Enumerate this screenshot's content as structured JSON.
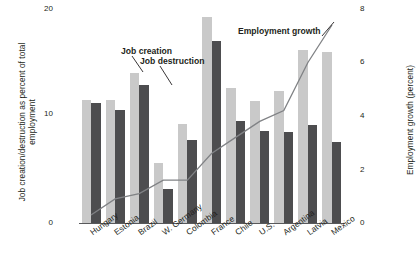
{
  "chart_data": {
    "type": "bar",
    "title": "",
    "categories": [
      "Hungary",
      "Estonia",
      "Brazil",
      "W. Germany",
      "Colombia",
      "France",
      "Chile",
      "U.S.",
      "Argentina",
      "Latvia",
      "Mexico"
    ],
    "series": [
      {
        "name": "Job creation",
        "axis": "left",
        "color": "#c9c9c9",
        "values": [
          11.5,
          11.5,
          14.0,
          5.6,
          9.3,
          19.3,
          12.6,
          11.4,
          12.3,
          16.2,
          16.0
        ]
      },
      {
        "name": "Job destruction",
        "axis": "left",
        "color": "#4d4d4f",
        "values": [
          11.2,
          10.6,
          12.9,
          3.2,
          7.8,
          17.0,
          9.5,
          8.6,
          8.5,
          9.2,
          7.6
        ]
      },
      {
        "name": "Employment growth",
        "axis": "right",
        "color": "#808285",
        "type": "line",
        "values": [
          0.3,
          0.9,
          1.1,
          1.6,
          1.6,
          2.6,
          3.2,
          3.8,
          4.2,
          6.0,
          7.4
        ]
      }
    ],
    "xlabel": "",
    "ylabel": "Job creation/destruction as percent of total employment",
    "ylabel_right": "Employment growth (percent)",
    "ylim": [
      0,
      20
    ],
    "yticks": [
      "0",
      "10",
      "20"
    ],
    "ylim_right": [
      0,
      8
    ],
    "yticks_right": [
      "0",
      "2",
      "4",
      "6",
      "8"
    ],
    "grid": false,
    "legend": "annotations",
    "annotations": [
      {
        "id": "job-creation",
        "text": "Job creation"
      },
      {
        "id": "job-destruction",
        "text": "Job destruction"
      },
      {
        "id": "employment-growth",
        "text": "Employment growth"
      }
    ]
  },
  "axis": {
    "left_title": "Job creation/destruction as percent of total employment",
    "right_title": "Employment growth (percent)",
    "left_ticks": {
      "t0": "0",
      "t1": "10",
      "t2": "20"
    },
    "right_ticks": {
      "t0": "0",
      "t1": "2",
      "t2": "4",
      "t3": "6",
      "t4": "8"
    }
  },
  "annotations": {
    "job_creation": "Job creation",
    "job_destruction": "Job destruction",
    "employment_growth": "Employment growth"
  },
  "categories": {
    "c0": "Hungary",
    "c1": "Estonia",
    "c2": "Brazil",
    "c3": "W. Germany",
    "c4": "Colombia",
    "c5": "France",
    "c6": "Chile",
    "c7": "U.S.",
    "c8": "Argentina",
    "c9": "Latvia",
    "c10": "Mexico"
  }
}
